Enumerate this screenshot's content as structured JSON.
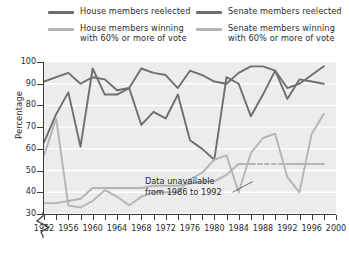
{
  "legend": {
    "entries": [
      {
        "label": "House members reelected",
        "color": "#6e6e6e",
        "column": "left"
      },
      {
        "label": "House members winning\nwith 60% or more of vote",
        "color": "#b4b4b4",
        "column": "left"
      },
      {
        "label": "Senate members reelected",
        "color": "#6e6e6e",
        "column": "right"
      },
      {
        "label": "Senate members winning\nwith 60% or more of vote",
        "color": "#b4b4b4",
        "column": "right"
      }
    ]
  },
  "axes": {
    "ylabel": "Percentage",
    "yticks": [
      "30",
      "40",
      "50",
      "60",
      "70",
      "80",
      "90",
      "100"
    ],
    "xticks": [
      "1952",
      "1956",
      "1960",
      "1964",
      "1968",
      "1972",
      "1976",
      "1980",
      "1984",
      "1988",
      "1992",
      "1996",
      "2000"
    ]
  },
  "annotation": {
    "text": "Data unavailable\nfrom 1986 to 1992"
  },
  "chart_data": {
    "type": "line",
    "title": "",
    "xlabel": "",
    "ylabel": "Percentage",
    "xlim": [
      1952,
      2000
    ],
    "ylim": [
      30,
      100
    ],
    "grid": "horizontal-white",
    "legend_position": "top",
    "x": [
      1952,
      1954,
      1956,
      1958,
      1960,
      1962,
      1964,
      1966,
      1968,
      1970,
      1972,
      1974,
      1976,
      1978,
      1980,
      1982,
      1984,
      1986,
      1988,
      1990,
      1992,
      1994,
      1996,
      1998
    ],
    "series": [
      {
        "name": "House members reelected",
        "color": "#6e6e6e",
        "values": [
          91,
          93,
          95,
          90,
          93,
          92,
          87,
          88,
          97,
          95,
          94,
          88,
          96,
          94,
          91,
          90,
          95,
          98,
          98,
          96,
          88,
          90,
          94,
          98
        ]
      },
      {
        "name": "House members winning with 60% or more of vote",
        "color": "#b4b4b4",
        "values": [
          35,
          35,
          36,
          37,
          42,
          42,
          42,
          42,
          42,
          43,
          43,
          43,
          44,
          45,
          45,
          48,
          53,
          53,
          53,
          53,
          53,
          53,
          53,
          53
        ],
        "gap": {
          "from": 1986,
          "to": 1992,
          "style": "dashed"
        }
      },
      {
        "name": "Senate members reelected",
        "color": "#6e6e6e",
        "values": [
          63,
          76,
          86,
          61,
          97,
          85,
          85,
          88,
          71,
          77,
          74,
          85,
          64,
          60,
          55,
          93,
          90,
          75,
          85,
          96,
          83,
          92,
          91,
          90
        ]
      },
      {
        "name": "Senate members winning with 60% or more of vote",
        "color": "#b4b4b4",
        "values": [
          57,
          74,
          34,
          33,
          36,
          41,
          38,
          34,
          38,
          40,
          40,
          40,
          46,
          49,
          55,
          57,
          40,
          58,
          65,
          67,
          47,
          40,
          67,
          76
        ]
      }
    ]
  }
}
